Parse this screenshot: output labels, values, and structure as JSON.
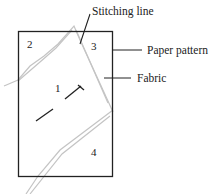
{
  "diagram": {
    "labels": {
      "stitching_line": "Stitching line",
      "paper_pattern": "Paper pattern",
      "fabric": "Fabric"
    },
    "regions": [
      "1",
      "2",
      "3",
      "4"
    ],
    "colors": {
      "pattern_outline": "#222222",
      "fabric_outline": "#bdbdbd",
      "leader_line": "#222222"
    }
  }
}
